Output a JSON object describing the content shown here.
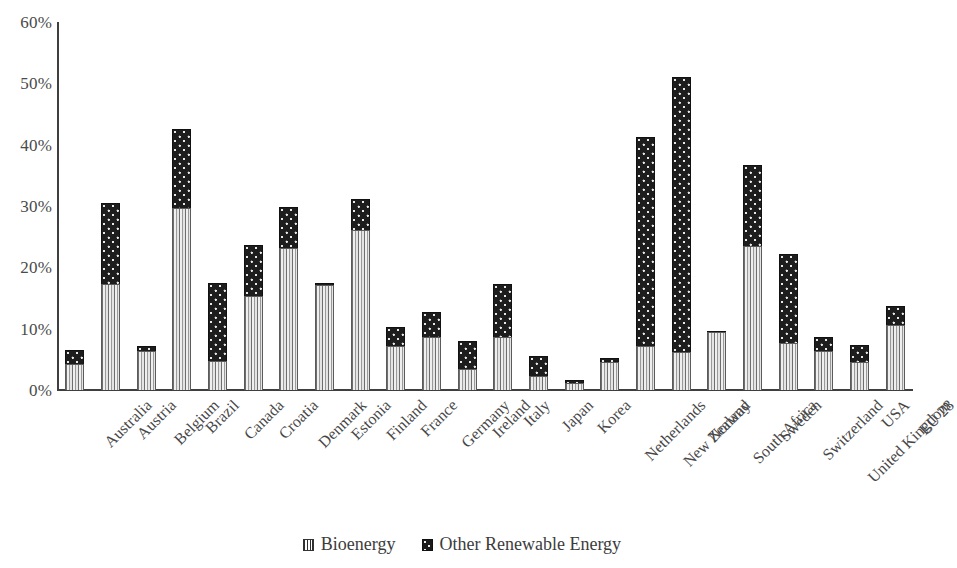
{
  "chart_data": {
    "type": "bar",
    "stacked": true,
    "title": "",
    "subtitle": "",
    "xlabel": "",
    "ylabel": "",
    "ylim": [
      0,
      60
    ],
    "ytick_labels": [
      "60%",
      "50%",
      "40%",
      "30%",
      "20%",
      "10%",
      "0%"
    ],
    "ytick_values": [
      60,
      50,
      40,
      30,
      20,
      10,
      0
    ],
    "grid": false,
    "legend_position": "bottom",
    "categories": [
      "Australia",
      "Austria",
      "Belgium",
      "Brazil",
      "Canada",
      "Croatia",
      "Denmark",
      "Estonia",
      "Finland",
      "France",
      "Germany",
      "Ireland",
      "Italy",
      "Japan",
      "Korea",
      "Netherlands",
      "New Zealand",
      "Norway",
      "South Africa",
      "Sweden",
      "Switzerland",
      "United Kingdom",
      "USA",
      "EU 28"
    ],
    "series": [
      {
        "name": "Bioenergy",
        "values": [
          4.2,
          17.3,
          6.4,
          29.6,
          4.8,
          15.3,
          23.2,
          17.2,
          26.1,
          7.2,
          8.7,
          3.5,
          8.6,
          2.3,
          1.2,
          4.6,
          7.1,
          6.2,
          9.4,
          23.5,
          7.6,
          6.3,
          4.6,
          10.6
        ],
        "pattern": "vertical-stripes"
      },
      {
        "name": "Other Renewable Energy",
        "values": [
          2.3,
          13.2,
          0.7,
          12.9,
          12.6,
          8.4,
          6.6,
          0.2,
          5.0,
          3.1,
          4.0,
          4.5,
          8.7,
          3.2,
          0.4,
          0.6,
          34.1,
          44.9,
          0.3,
          13.2,
          14.6,
          2.4,
          2.8,
          3.1
        ],
        "pattern": "dots"
      }
    ],
    "totals": [
      6.5,
      30.5,
      7.1,
      42.5,
      17.4,
      23.7,
      29.8,
      17.4,
      31.1,
      10.3,
      12.7,
      8.0,
      17.3,
      5.5,
      1.6,
      5.2,
      41.2,
      51.1,
      9.7,
      36.7,
      22.2,
      8.7,
      7.4,
      13.7
    ]
  },
  "legend": {
    "items": [
      {
        "label": "Bioenergy",
        "swatch": "vertical-stripe-swatch"
      },
      {
        "label": "Other Renewable Energy",
        "swatch": "dotted-swatch"
      }
    ]
  },
  "colors": {
    "bioenergy": "#d9d9d9",
    "other_renewable": "#1d1d1d",
    "axis": "#3f3f3f",
    "text": "#434343",
    "background": "#ffffff"
  }
}
